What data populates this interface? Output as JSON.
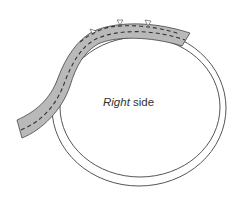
{
  "diagram": {
    "label_italic": "Right",
    "label_rest": " side",
    "colors": {
      "ring_stroke": "#555555",
      "strip_fill": "#b9b9b9",
      "strip_stroke": "#444444",
      "stitch": "#333333",
      "background": "#ffffff"
    }
  }
}
